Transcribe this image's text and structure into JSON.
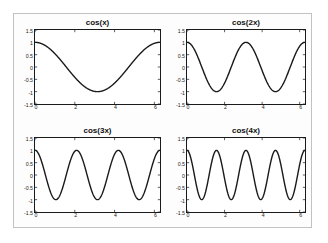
{
  "figure": {
    "background_color": "#fdfdfd",
    "border_color": "#c2c2c2",
    "page_background": "#ffffff"
  },
  "chart_data": [
    {
      "type": "line",
      "title": "cos(x)",
      "xlabel": "",
      "ylabel": "",
      "xlim": [
        0,
        6.2832
      ],
      "ylim": [
        -1.5,
        1.5
      ],
      "xticks": [
        0,
        2,
        4,
        6
      ],
      "xticklabels": [
        "0",
        "2",
        "4",
        "6"
      ],
      "yticks": [
        -1.5,
        -1,
        -0.5,
        0,
        0.5,
        1,
        1.5
      ],
      "yticklabels": [
        "-1.5",
        "-1",
        "-0.5",
        "0",
        "0.5",
        "1",
        "1.5"
      ],
      "grid": false,
      "legend": null,
      "line_color": "#1a1a1a",
      "line_width": 1.4,
      "frequency": 1,
      "amplitude": 1,
      "expression": "cos(x)",
      "periods_shown": 1
    },
    {
      "type": "line",
      "title": "cos(2x)",
      "xlabel": "",
      "ylabel": "",
      "xlim": [
        0,
        6.2832
      ],
      "ylim": [
        -1.5,
        1.5
      ],
      "xticks": [
        0,
        2,
        4,
        6
      ],
      "xticklabels": [
        "0",
        "2",
        "4",
        "6"
      ],
      "yticks": [
        -1.5,
        -1,
        -0.5,
        0,
        0.5,
        1,
        1.5
      ],
      "yticklabels": [
        "-1.5",
        "-1",
        "-0.5",
        "0",
        "0.5",
        "1",
        "1.5"
      ],
      "grid": false,
      "legend": null,
      "line_color": "#1a1a1a",
      "line_width": 1.4,
      "frequency": 2,
      "amplitude": 1,
      "expression": "cos(2x)",
      "periods_shown": 2
    },
    {
      "type": "line",
      "title": "cos(3x)",
      "xlabel": "",
      "ylabel": "",
      "xlim": [
        0,
        6.2832
      ],
      "ylim": [
        -1.5,
        1.5
      ],
      "xticks": [
        0,
        2,
        4,
        6
      ],
      "xticklabels": [
        "0",
        "2",
        "4",
        "6"
      ],
      "yticks": [
        -1.5,
        -1,
        -0.5,
        0,
        0.5,
        1,
        1.5
      ],
      "yticklabels": [
        "-1.5",
        "-1",
        "-0.5",
        "0",
        "0.5",
        "1",
        "1.5"
      ],
      "grid": false,
      "legend": null,
      "line_color": "#1a1a1a",
      "line_width": 1.4,
      "frequency": 3,
      "amplitude": 1,
      "expression": "cos(3x)",
      "periods_shown": 3
    },
    {
      "type": "line",
      "title": "cos(4x)",
      "xlabel": "",
      "ylabel": "",
      "xlim": [
        0,
        6.2832
      ],
      "ylim": [
        -1.5,
        1.5
      ],
      "xticks": [
        0,
        2,
        4,
        6
      ],
      "xticklabels": [
        "0",
        "2",
        "4",
        "6"
      ],
      "yticks": [
        -1.5,
        -1,
        -0.5,
        0,
        0.5,
        1,
        1.5
      ],
      "yticklabels": [
        "-1.5",
        "-1",
        "-0.5",
        "0",
        "0.5",
        "1",
        "1.5"
      ],
      "grid": false,
      "legend": null,
      "line_color": "#1a1a1a",
      "line_width": 1.4,
      "frequency": 4,
      "amplitude": 1,
      "expression": "cos(4x)",
      "periods_shown": 4
    }
  ],
  "layout": {
    "rows": 2,
    "cols": 2,
    "panels": [
      {
        "left": 20,
        "top": 4,
        "width": 127,
        "height": 96
      },
      {
        "left": 172,
        "top": 4,
        "width": 120,
        "height": 96
      },
      {
        "left": 20,
        "top": 112,
        "width": 127,
        "height": 96
      },
      {
        "left": 172,
        "top": 112,
        "width": 120,
        "height": 96
      }
    ]
  }
}
